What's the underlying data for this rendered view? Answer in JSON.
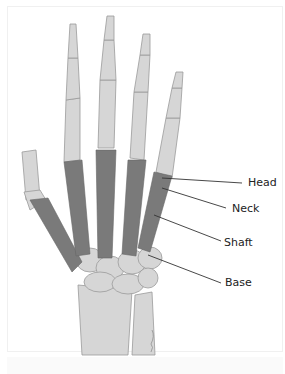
{
  "figure": {
    "highlighted_bones": "metacarpals",
    "colors": {
      "highlight": "#7a7a7a",
      "bone": "#d6d6d6",
      "bone_outline": "#9a9a9a",
      "leader_line": "#333333",
      "text": "#222222"
    }
  },
  "labels": [
    {
      "text": "Head"
    },
    {
      "text": "Neck"
    },
    {
      "text": "Shaft"
    },
    {
      "text": "Base"
    }
  ],
  "caption": {
    "text": ""
  }
}
